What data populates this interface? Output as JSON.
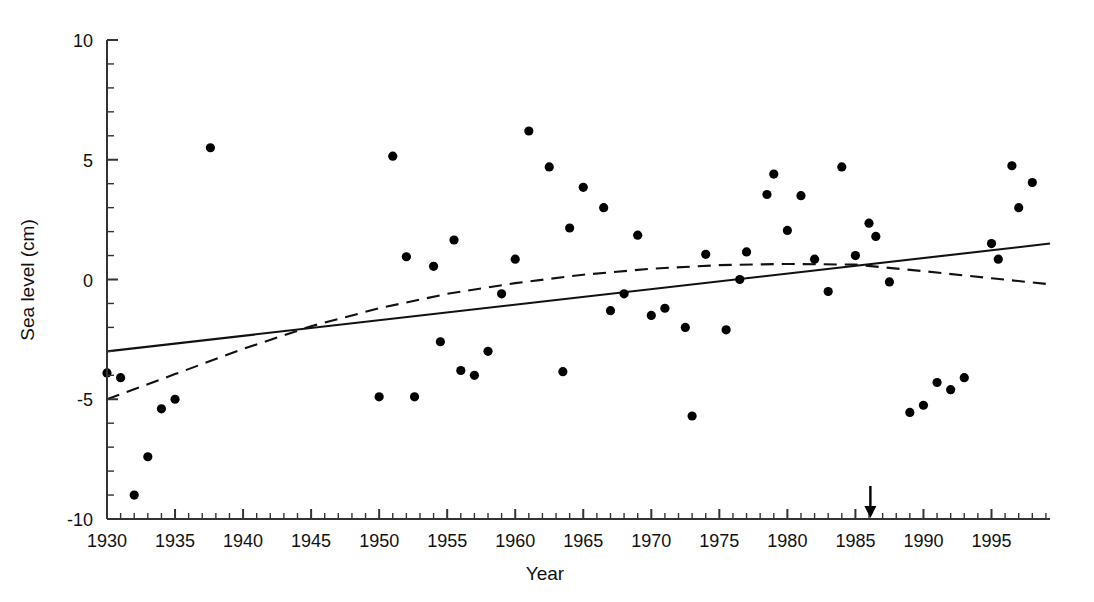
{
  "chart_data": {
    "type": "scatter",
    "title": "",
    "subtitle": "",
    "xlabel": "Year",
    "ylabel": "Sea level (cm)",
    "xlim": [
      1930,
      1999.3
    ],
    "ylim": [
      -10,
      10
    ],
    "xticks_major": [
      1930,
      1935,
      1940,
      1945,
      1950,
      1955,
      1960,
      1965,
      1970,
      1975,
      1980,
      1985,
      1990,
      1995
    ],
    "xtick_labels": [
      "1930",
      "1935",
      "1940",
      "1945",
      "1950",
      "1955",
      "1960",
      "1965",
      "1970",
      "1975",
      "1980",
      "1985",
      "1990",
      "1995"
    ],
    "xticks_minor_step": 1,
    "yticks_major": [
      -10,
      -5,
      0,
      5,
      10
    ],
    "ytick_labels": [
      "-10",
      "-5",
      "0",
      "5",
      "10"
    ],
    "yticks_minor_step": 1,
    "grid": false,
    "legend": null,
    "marker": {
      "shape": "circle",
      "color": "#000000",
      "size_px": 9
    },
    "series": [
      {
        "name": "Annual mean sea level",
        "type": "scatter",
        "points": [
          {
            "x": 1930,
            "y": -3.9
          },
          {
            "x": 1931,
            "y": -4.1
          },
          {
            "x": 1932,
            "y": -9.0
          },
          {
            "x": 1933,
            "y": -7.4
          },
          {
            "x": 1934,
            "y": -5.4
          },
          {
            "x": 1935,
            "y": -5.0
          },
          {
            "x": 1937.6,
            "y": 5.5
          },
          {
            "x": 1950,
            "y": -4.9
          },
          {
            "x": 1951,
            "y": 5.15
          },
          {
            "x": 1952,
            "y": 0.95
          },
          {
            "x": 1952.6,
            "y": -4.9
          },
          {
            "x": 1954,
            "y": 0.55
          },
          {
            "x": 1954.5,
            "y": -2.6
          },
          {
            "x": 1955.5,
            "y": 1.65
          },
          {
            "x": 1956,
            "y": -3.8
          },
          {
            "x": 1957,
            "y": -4.0
          },
          {
            "x": 1958,
            "y": -3.0
          },
          {
            "x": 1959,
            "y": -0.6
          },
          {
            "x": 1960,
            "y": 0.85
          },
          {
            "x": 1961,
            "y": 6.2
          },
          {
            "x": 1962.5,
            "y": 4.7
          },
          {
            "x": 1963.5,
            "y": -3.85
          },
          {
            "x": 1964,
            "y": 2.15
          },
          {
            "x": 1965,
            "y": 3.85
          },
          {
            "x": 1966.5,
            "y": 3.0
          },
          {
            "x": 1967,
            "y": -1.3
          },
          {
            "x": 1968,
            "y": -0.6
          },
          {
            "x": 1969,
            "y": 1.85
          },
          {
            "x": 1970,
            "y": -1.5
          },
          {
            "x": 1971,
            "y": -1.2
          },
          {
            "x": 1972.5,
            "y": -2.0
          },
          {
            "x": 1973,
            "y": -5.7
          },
          {
            "x": 1974,
            "y": 1.05
          },
          {
            "x": 1975.5,
            "y": -2.1
          },
          {
            "x": 1976.5,
            "y": 0.0
          },
          {
            "x": 1977,
            "y": 1.15
          },
          {
            "x": 1978.5,
            "y": 3.55
          },
          {
            "x": 1979,
            "y": 4.4
          },
          {
            "x": 1980,
            "y": 2.05
          },
          {
            "x": 1981,
            "y": 3.5
          },
          {
            "x": 1982,
            "y": 0.85
          },
          {
            "x": 1983,
            "y": -0.5
          },
          {
            "x": 1984,
            "y": 4.7
          },
          {
            "x": 1985,
            "y": 1.0
          },
          {
            "x": 1986,
            "y": 2.35
          },
          {
            "x": 1986.5,
            "y": 1.8
          },
          {
            "x": 1987.5,
            "y": -0.1
          },
          {
            "x": 1989,
            "y": -5.55
          },
          {
            "x": 1990,
            "y": -5.25
          },
          {
            "x": 1991,
            "y": -4.3
          },
          {
            "x": 1992,
            "y": -4.6
          },
          {
            "x": 1993,
            "y": -4.1
          },
          {
            "x": 1995,
            "y": 1.5
          },
          {
            "x": 1995.5,
            "y": 0.85
          },
          {
            "x": 1996.5,
            "y": 4.75
          },
          {
            "x": 1997,
            "y": 3.0
          },
          {
            "x": 1998,
            "y": 4.05
          }
        ]
      },
      {
        "name": "Linear trend",
        "type": "line",
        "style": "solid",
        "points": [
          {
            "x": 1930,
            "y": -3.0
          },
          {
            "x": 1999.3,
            "y": 1.5
          }
        ]
      },
      {
        "name": "Smoothed trend",
        "type": "line",
        "style": "dashed",
        "points": [
          {
            "x": 1930,
            "y": -5.0
          },
          {
            "x": 1935,
            "y": -3.95
          },
          {
            "x": 1940,
            "y": -2.9
          },
          {
            "x": 1945,
            "y": -1.95
          },
          {
            "x": 1950,
            "y": -1.2
          },
          {
            "x": 1955,
            "y": -0.6
          },
          {
            "x": 1960,
            "y": -0.15
          },
          {
            "x": 1965,
            "y": 0.2
          },
          {
            "x": 1970,
            "y": 0.45
          },
          {
            "x": 1975,
            "y": 0.6
          },
          {
            "x": 1980,
            "y": 0.65
          },
          {
            "x": 1985,
            "y": 0.62
          },
          {
            "x": 1990,
            "y": 0.35
          },
          {
            "x": 1995,
            "y": 0.05
          },
          {
            "x": 1999.3,
            "y": -0.2
          }
        ]
      }
    ],
    "annotations": [
      {
        "name": "year-marker-arrow",
        "type": "down-arrow",
        "x": 1986.1,
        "label": ""
      }
    ]
  },
  "axes": {
    "x_axis_label": "Year",
    "y_axis_label": "Sea level (cm)"
  }
}
